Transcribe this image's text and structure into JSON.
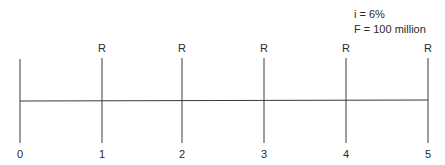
{
  "diagram": {
    "type": "cash-flow-timeline",
    "annotation": {
      "interest": "i = 6%",
      "future_value": "F = 100 million"
    },
    "periods": [
      {
        "label": "0",
        "flow": ""
      },
      {
        "label": "1",
        "flow": "R"
      },
      {
        "label": "2",
        "flow": "R"
      },
      {
        "label": "3",
        "flow": "R"
      },
      {
        "label": "4",
        "flow": "R"
      },
      {
        "label": "5",
        "flow": "R"
      }
    ],
    "line_color": "#3a3a3a"
  }
}
